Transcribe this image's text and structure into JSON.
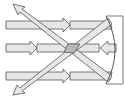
{
  "diagram": {
    "colors": {
      "background": "#ffffff",
      "stroke": "#555555",
      "ray_fill": "#e6e6e6",
      "focus_fill": "#b8b8b8"
    },
    "elements": {
      "incident_rays": 3,
      "reflected_rays": 3,
      "mirror": "concave-mirror",
      "focal_point": "focal-point"
    }
  }
}
